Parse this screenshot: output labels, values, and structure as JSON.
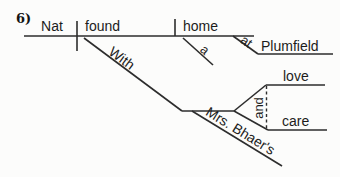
{
  "page": {
    "background_color": "#fcfcfb",
    "ink_color": "#2d2d2d"
  },
  "exercise": {
    "number_label": "6)"
  },
  "diagram": {
    "type": "reed-kellogg-sentence-diagram",
    "subject": "Nat",
    "verb": "found",
    "direct_object": "home",
    "article_modifier_of_object": "a",
    "preposition_at": "at",
    "object_of_preposition_at": "Plumfield",
    "preposition_with": "With",
    "possessive_modifier": "Mrs. Bhaer's",
    "conjunction": "and",
    "coordinate_objects_of_with": [
      "love",
      "care"
    ]
  }
}
